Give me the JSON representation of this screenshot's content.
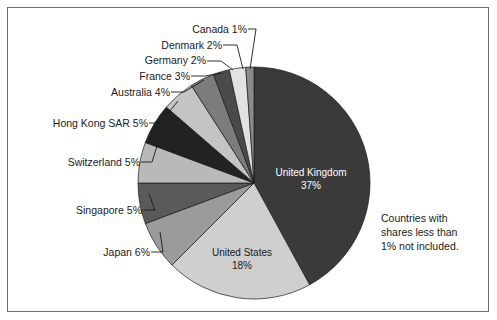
{
  "figure": {
    "background_color": "#ffffff",
    "border_color": "#6d6d6d",
    "note": {
      "line1": "Countries with",
      "line2": "shares less than",
      "line3": "1% not included."
    }
  },
  "chart_data": {
    "type": "pie",
    "title": "",
    "xlabel": "",
    "ylabel": "",
    "legend_position": "none",
    "grid": false,
    "start_angle_deg": 0,
    "direction": "clockwise",
    "total_labeled_percent": 98,
    "categories": [
      "United Kingdom",
      "United States",
      "Japan",
      "Singapore",
      "Switzerland",
      "Hong Kong SAR",
      "Australia",
      "France",
      "Germany",
      "Denmark",
      "Canada"
    ],
    "values": [
      37,
      18,
      6,
      5,
      5,
      5,
      4,
      3,
      2,
      2,
      1
    ],
    "slices": [
      {
        "name": "United Kingdom",
        "value": 37,
        "label": "United Kingdom",
        "percent_label": "37%",
        "color": "#3a3a3a",
        "label_placement": "inside",
        "label_text_color": "#ffffff"
      },
      {
        "name": "United States",
        "value": 18,
        "label": "United States",
        "percent_label": "18%",
        "color": "#cfcfcf",
        "label_placement": "inside",
        "label_text_color": "#1a1a1a"
      },
      {
        "name": "Japan",
        "value": 6,
        "label": "Japan 6%",
        "percent_label": "6%",
        "color": "#9b9b9b",
        "label_placement": "callout",
        "label_text_color": "#1a1a1a"
      },
      {
        "name": "Singapore",
        "value": 5,
        "label": "Singapore 5%",
        "percent_label": "5%",
        "color": "#5a5a5a",
        "label_placement": "callout",
        "label_text_color": "#1a1a1a"
      },
      {
        "name": "Switzerland",
        "value": 5,
        "label": "Switzerland 5%",
        "percent_label": "5%",
        "color": "#b9b9b9",
        "label_placement": "callout",
        "label_text_color": "#1a1a1a"
      },
      {
        "name": "Hong Kong SAR",
        "value": 5,
        "label": "Hong Kong SAR 5%",
        "percent_label": "5%",
        "color": "#222222",
        "label_placement": "callout",
        "label_text_color": "#1a1a1a"
      },
      {
        "name": "Australia",
        "value": 4,
        "label": "Australia 4%",
        "percent_label": "4%",
        "color": "#c4c4c4",
        "label_placement": "callout",
        "label_text_color": "#1a1a1a"
      },
      {
        "name": "France",
        "value": 3,
        "label": "France 3%",
        "percent_label": "3%",
        "color": "#7c7c7c",
        "label_placement": "callout",
        "label_text_color": "#1a1a1a"
      },
      {
        "name": "Germany",
        "value": 2,
        "label": "Germany 2%",
        "percent_label": "2%",
        "color": "#4a4a4a",
        "label_placement": "callout",
        "label_text_color": "#1a1a1a"
      },
      {
        "name": "Denmark",
        "value": 2,
        "label": "Denmark 2%",
        "percent_label": "2%",
        "color": "#e2e2e2",
        "label_placement": "callout",
        "label_text_color": "#1a1a1a"
      },
      {
        "name": "Canada",
        "value": 1,
        "label": "Canada 1%",
        "percent_label": "1%",
        "color": "#8a8a8a",
        "label_placement": "callout",
        "label_text_color": "#1a1a1a"
      }
    ],
    "callouts": [
      {
        "name": "Canada",
        "text": "Canada 1%",
        "text_x": 247,
        "text_y": 33,
        "elbow_x": 256,
        "elbow_y": 29,
        "tip_x": 250,
        "tip_y": 69
      },
      {
        "name": "Denmark",
        "text": "Denmark 2%",
        "text_x": 222,
        "text_y": 49,
        "elbow_x": 237,
        "elbow_y": 45,
        "tip_x": 243,
        "tip_y": 69
      },
      {
        "name": "Germany",
        "text": "Germany 2%",
        "text_x": 206,
        "text_y": 64,
        "elbow_x": 221,
        "elbow_y": 61,
        "tip_x": 233,
        "tip_y": 70
      },
      {
        "name": "France",
        "text": "France 3%",
        "text_x": 190,
        "text_y": 80,
        "elbow_x": 205,
        "elbow_y": 76,
        "tip_x": 222,
        "tip_y": 73
      },
      {
        "name": "Australia",
        "text": "Australia 4%",
        "text_x": 170,
        "text_y": 96,
        "elbow_x": 184,
        "elbow_y": 92,
        "tip_x": 204,
        "tip_y": 80
      },
      {
        "name": "Hong Kong SAR",
        "text": "Hong Kong SAR 5%",
        "text_x": 148,
        "text_y": 127,
        "elbow_x": 160,
        "elbow_y": 123,
        "tip_x": 178,
        "tip_y": 101
      },
      {
        "name": "Switzerland",
        "text": "Switzerland 5%",
        "text_x": 140,
        "text_y": 166,
        "elbow_x": 152,
        "elbow_y": 162,
        "tip_x": 158,
        "tip_y": 143
      },
      {
        "name": "Singapore",
        "text": "Singapore 5%",
        "text_x": 142,
        "text_y": 214,
        "elbow_x": 155,
        "elbow_y": 210,
        "tip_x": 149,
        "tip_y": 194
      },
      {
        "name": "Japan",
        "text": "Japan 6%",
        "text_x": 150,
        "text_y": 256,
        "elbow_x": 163,
        "elbow_y": 252,
        "tip_x": 160,
        "tip_y": 232
      }
    ],
    "inside_labels": [
      {
        "name": "United Kingdom",
        "line1": "United Kingdom",
        "line2": "37%",
        "x": 311,
        "y": 176
      },
      {
        "name": "United States",
        "line1": "United States",
        "line2": "18%",
        "x": 242,
        "y": 256
      }
    ],
    "geometry": {
      "center_x": 254,
      "center_y": 183,
      "radius": 116
    }
  }
}
